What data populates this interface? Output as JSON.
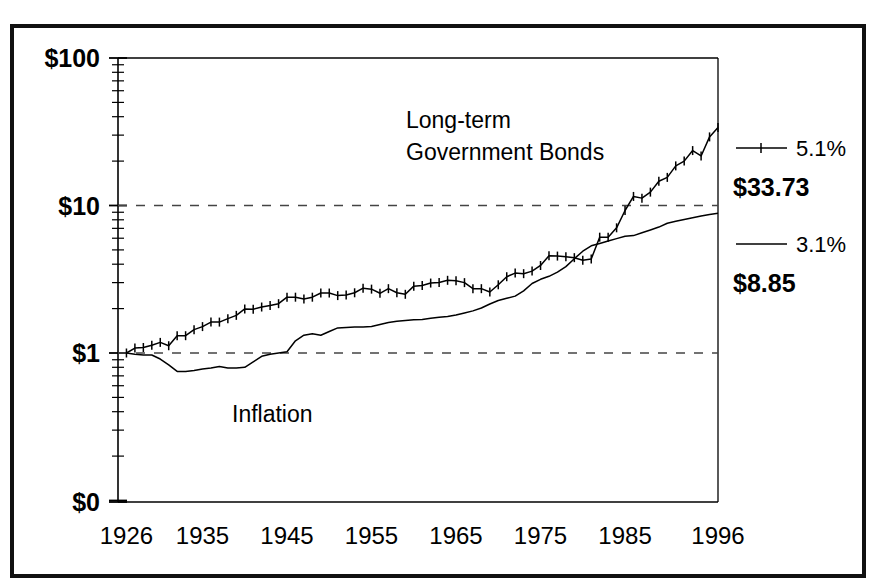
{
  "figure": {
    "background_color": "#ffffff",
    "border_color": "#111111",
    "line_color": "#000000"
  },
  "chart_data": {
    "type": "line",
    "title": "",
    "xlabel": "",
    "ylabel": "",
    "scale": "log",
    "grid": "dashed horizontal gridlines at $1 and $10",
    "legend_position": "right",
    "xlim": [
      1925,
      1996
    ],
    "ylim": [
      0.1,
      100
    ],
    "xticks": [
      1926,
      1935,
      1945,
      1955,
      1965,
      1975,
      1985,
      1996
    ],
    "xticklabels": [
      "1926",
      "1935",
      "1945",
      "1955",
      "1965",
      "1975",
      "1985",
      "1996"
    ],
    "yticks": [
      100,
      10,
      1,
      0
    ],
    "yticklabels": [
      "$100",
      "$10",
      "$1",
      "$0"
    ],
    "gridline_values": [
      10,
      1
    ],
    "annotations": [
      {
        "text": "Long-term",
        "x": 1966,
        "y": 55
      },
      {
        "text": "Government Bonds",
        "x": 1966,
        "y": 40
      },
      {
        "text": "Inflation",
        "x": 1943,
        "y": 0.47
      }
    ],
    "series": [
      {
        "name": "Long-term Government Bonds",
        "marker": "tick",
        "return_pct": "5.1%",
        "end_value": "$33.73",
        "x": [
          1926,
          1927,
          1928,
          1929,
          1930,
          1931,
          1932,
          1933,
          1934,
          1935,
          1936,
          1937,
          1938,
          1939,
          1940,
          1941,
          1942,
          1943,
          1944,
          1945,
          1946,
          1947,
          1948,
          1949,
          1950,
          1951,
          1952,
          1953,
          1954,
          1955,
          1956,
          1957,
          1958,
          1959,
          1960,
          1961,
          1962,
          1963,
          1964,
          1965,
          1966,
          1967,
          1968,
          1969,
          1970,
          1971,
          1972,
          1973,
          1974,
          1975,
          1976,
          1977,
          1978,
          1979,
          1980,
          1981,
          1982,
          1983,
          1984,
          1985,
          1986,
          1987,
          1988,
          1989,
          1990,
          1991,
          1992,
          1993,
          1994,
          1995,
          1996
        ],
        "values": [
          1.0,
          1.08,
          1.09,
          1.13,
          1.18,
          1.12,
          1.31,
          1.31,
          1.44,
          1.51,
          1.62,
          1.62,
          1.71,
          1.8,
          1.99,
          1.98,
          2.05,
          2.1,
          2.16,
          2.39,
          2.39,
          2.32,
          2.39,
          2.55,
          2.55,
          2.45,
          2.47,
          2.56,
          2.75,
          2.71,
          2.54,
          2.73,
          2.56,
          2.5,
          2.84,
          2.87,
          2.98,
          3.01,
          3.11,
          3.09,
          3.0,
          2.73,
          2.73,
          2.59,
          2.9,
          3.29,
          3.48,
          3.45,
          3.59,
          3.92,
          4.57,
          4.54,
          4.49,
          4.43,
          4.26,
          4.34,
          6.1,
          6.1,
          7.06,
          9.25,
          11.52,
          11.22,
          12.32,
          14.61,
          15.51,
          18.56,
          20.0,
          23.57,
          21.67,
          29.18,
          33.73
        ]
      },
      {
        "name": "Inflation",
        "marker": "none",
        "return_pct": "3.1%",
        "end_value": "$8.85",
        "x": [
          1926,
          1927,
          1928,
          1929,
          1930,
          1931,
          1932,
          1933,
          1934,
          1935,
          1936,
          1937,
          1938,
          1939,
          1940,
          1941,
          1942,
          1943,
          1944,
          1945,
          1946,
          1947,
          1948,
          1949,
          1950,
          1951,
          1952,
          1953,
          1954,
          1955,
          1956,
          1957,
          1958,
          1959,
          1960,
          1961,
          1962,
          1963,
          1964,
          1965,
          1966,
          1967,
          1968,
          1969,
          1970,
          1971,
          1972,
          1973,
          1974,
          1975,
          1976,
          1977,
          1978,
          1979,
          1980,
          1981,
          1982,
          1983,
          1984,
          1985,
          1986,
          1987,
          1988,
          1989,
          1990,
          1991,
          1992,
          1993,
          1994,
          1995,
          1996
        ],
        "values": [
          1.0,
          0.98,
          0.97,
          0.97,
          0.91,
          0.83,
          0.75,
          0.75,
          0.76,
          0.78,
          0.79,
          0.81,
          0.79,
          0.79,
          0.8,
          0.87,
          0.95,
          0.98,
          1.0,
          1.02,
          1.21,
          1.32,
          1.35,
          1.32,
          1.4,
          1.48,
          1.49,
          1.5,
          1.5,
          1.51,
          1.56,
          1.61,
          1.64,
          1.66,
          1.68,
          1.69,
          1.72,
          1.75,
          1.77,
          1.81,
          1.87,
          1.93,
          2.02,
          2.15,
          2.27,
          2.35,
          2.43,
          2.64,
          2.96,
          3.16,
          3.31,
          3.53,
          3.85,
          4.36,
          4.9,
          5.33,
          5.53,
          5.74,
          5.96,
          6.18,
          6.25,
          6.53,
          6.82,
          7.14,
          7.58,
          7.81,
          8.04,
          8.26,
          8.48,
          8.69,
          8.85
        ]
      }
    ]
  },
  "axis": {
    "y_labels": [
      {
        "text": "$100",
        "value": 100
      },
      {
        "text": "$10",
        "value": 10
      },
      {
        "text": "$1",
        "value": 1
      },
      {
        "text": "$0",
        "value": 0
      }
    ],
    "x_labels": [
      "1926",
      "1935",
      "1945",
      "1955",
      "1965",
      "1975",
      "1985",
      "1996"
    ]
  },
  "legend": {
    "entries": [
      {
        "marker": "line-with-ticks",
        "percent": "5.1%",
        "value": "$33.73",
        "series": "Long-term Government Bonds"
      },
      {
        "marker": "plain-line",
        "percent": "3.1%",
        "value": "$8.85",
        "series": "Inflation"
      }
    ]
  },
  "annotations": {
    "bonds_line1": "Long-term",
    "bonds_line2": "Government Bonds",
    "inflation": "Inflation"
  }
}
